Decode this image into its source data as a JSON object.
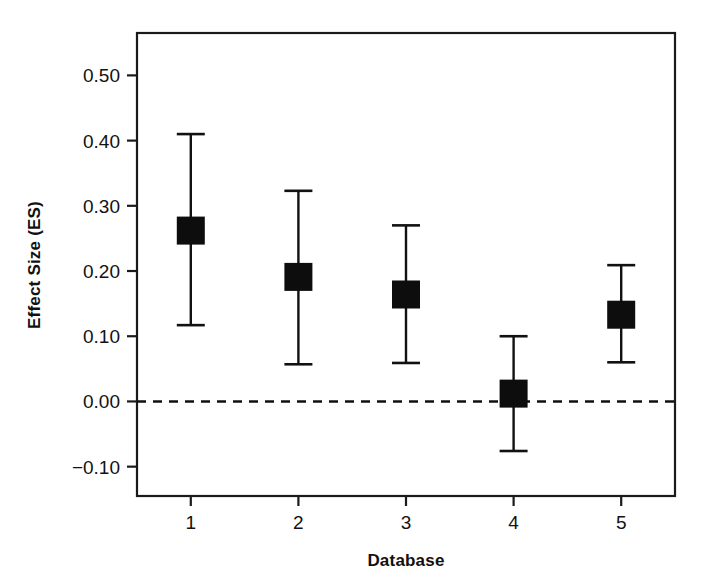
{
  "chart_data": {
    "type": "scatter",
    "title": "",
    "xlabel": "Database",
    "ylabel": "Effect Size (ES)",
    "categories": [
      "1",
      "2",
      "3",
      "4",
      "5"
    ],
    "values": [
      0.262,
      0.191,
      0.164,
      0.012,
      0.133
    ],
    "error_low": [
      0.117,
      0.057,
      0.059,
      -0.076,
      0.06
    ],
    "error_high": [
      0.41,
      0.323,
      0.27,
      0.1,
      0.209
    ],
    "series": [
      {
        "name": "Effect Size (ES)",
        "points": [
          {
            "x": "1",
            "y": 0.262,
            "ci_low": 0.117,
            "ci_high": 0.41
          },
          {
            "x": "2",
            "y": 0.191,
            "ci_low": 0.057,
            "ci_high": 0.323
          },
          {
            "x": "3",
            "y": 0.164,
            "ci_low": 0.059,
            "ci_high": 0.27
          },
          {
            "x": "4",
            "y": 0.012,
            "ci_low": -0.076,
            "ci_high": 0.1
          },
          {
            "x": "5",
            "y": 0.133,
            "ci_low": 0.06,
            "ci_high": 0.209
          }
        ]
      }
    ],
    "ylim": [
      -0.145,
      0.565
    ],
    "xlim": [
      0.5,
      5.5
    ],
    "ytick_values": [
      0.5,
      0.4,
      0.3,
      0.2,
      0.1,
      0.0,
      -0.1
    ],
    "ytick_labels": [
      "0.50",
      "0.40",
      "0.30",
      "0.20",
      "0.10",
      "0.00",
      "−0.10"
    ],
    "xtick_labels": [
      "1",
      "2",
      "3",
      "4",
      "5"
    ],
    "grid": false,
    "legend": null,
    "reference_line": {
      "value": 0.0,
      "style": "dashed"
    },
    "marker": "filled-square",
    "colors": {
      "marker": "#0d0d0d",
      "line": "#111111",
      "axis": "#1a1a1a",
      "background": "#ffffff"
    }
  },
  "axes": {
    "y_title": "Effect Size (ES)",
    "x_title": "Database"
  }
}
